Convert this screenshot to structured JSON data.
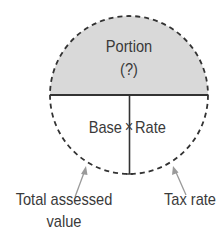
{
  "diagram": {
    "type": "formula-circle",
    "top_half": {
      "label": "Portion",
      "sub_label": "(?)",
      "fill_color": "#d9d9d9"
    },
    "bottom_half": {
      "left_label": "Base",
      "operator": "×",
      "right_label": "Rate"
    },
    "callouts": {
      "base_caption_line1": "Total assessed",
      "base_caption_line2": "value",
      "rate_caption": "Tax rate"
    },
    "colors": {
      "stroke": "#333333",
      "arrow": "#9a9a9a",
      "text": "#3a3a3a"
    }
  }
}
